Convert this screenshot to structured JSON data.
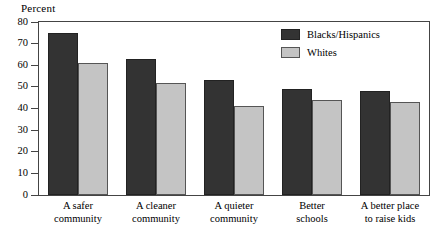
{
  "chart_data": {
    "type": "bar",
    "title": "",
    "ylabel": "Percent",
    "xlabel": "",
    "ylim": [
      0,
      80
    ],
    "yticks": [
      0,
      10,
      20,
      30,
      40,
      50,
      60,
      70,
      80
    ],
    "ytick_labels": [
      "0",
      "10",
      "20",
      "30",
      "40",
      "50",
      "60",
      "70",
      "80"
    ],
    "grid": false,
    "legend_position": "top-right-inset",
    "categories": [
      "A safer community",
      "A cleaner community",
      "A quieter community",
      "Better schools",
      "A better place to raise kids"
    ],
    "category_lines": [
      [
        "A safer",
        "community"
      ],
      [
        "A cleaner",
        "community"
      ],
      [
        "A quieter",
        "community"
      ],
      [
        "Better",
        "schools"
      ],
      [
        "A better place",
        "to raise kids"
      ]
    ],
    "series": [
      {
        "name": "Blacks/Hispanics",
        "color": "#333333",
        "values": [
          75,
          63,
          53,
          49,
          48
        ]
      },
      {
        "name": "Whites",
        "color": "#c4c4c4",
        "values": [
          61,
          52,
          41,
          44,
          43
        ]
      }
    ]
  },
  "legend": {
    "items": [
      {
        "label": "Blacks/Hispanics",
        "swatch": "dark"
      },
      {
        "label": "Whites",
        "swatch": "light"
      }
    ]
  }
}
